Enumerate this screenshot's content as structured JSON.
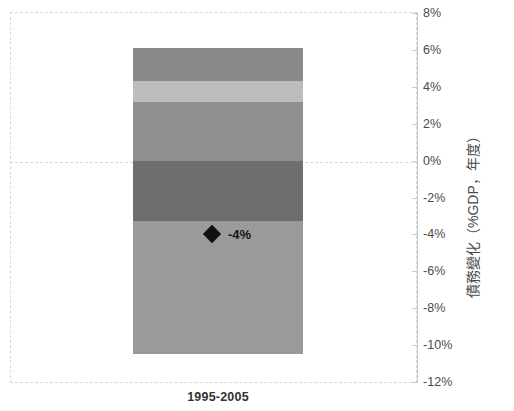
{
  "chart_data": {
    "type": "bar",
    "title": "",
    "subtitle": "",
    "xlabel": "",
    "ylabel": "債務變化（%GDP，年度）",
    "categories": [
      "1995-2005"
    ],
    "ylim": [
      -12,
      8
    ],
    "ytick_labels": [
      "8%",
      "6%",
      "4%",
      "2%",
      "0%",
      "-2%",
      "-4%",
      "-6%",
      "-8%",
      "-10%",
      "-12%"
    ],
    "ytick_values": [
      8,
      6,
      4,
      2,
      0,
      -2,
      -4,
      -6,
      -8,
      -10,
      -12
    ],
    "grid": "zero-line-only",
    "legend": "none",
    "stacked": true,
    "series": [
      {
        "name": "segment-1",
        "values": [
          1.8
        ],
        "range": [
          4.3,
          6.1
        ],
        "color": "#8a8a8a"
      },
      {
        "name": "segment-2",
        "values": [
          1.1
        ],
        "range": [
          3.2,
          4.3
        ],
        "color": "#bdbdbd"
      },
      {
        "name": "segment-3",
        "values": [
          3.2
        ],
        "range": [
          0.0,
          3.2
        ],
        "color": "#8f8f8f"
      },
      {
        "name": "segment-4",
        "values": [
          -3.3
        ],
        "range": [
          -3.3,
          0.0
        ],
        "color": "#6e6e6e"
      },
      {
        "name": "segment-5",
        "values": [
          -7.2
        ],
        "range": [
          -10.5,
          -3.3
        ],
        "color": "#9a9a9a"
      }
    ],
    "annotations": [
      {
        "name": "net-change-marker",
        "label": "-4%",
        "value": -4,
        "marker": "diamond",
        "color": "#111111"
      }
    ],
    "total_top": 6.1,
    "total_bottom": -10.5
  },
  "axis": {
    "title": "債務變化（%GDP，年度）",
    "ticks": [
      "8%",
      "6%",
      "4%",
      "2%",
      "0%",
      "-2%",
      "-4%",
      "-6%",
      "-8%",
      "-10%",
      "-12%"
    ]
  },
  "category": {
    "label": "1995-2005"
  },
  "marker": {
    "label": "-4%"
  },
  "colors": {
    "segment_1": "#8a8a8a",
    "segment_2": "#bdbdbd",
    "segment_3": "#8f8f8f",
    "segment_4": "#6e6e6e",
    "segment_5": "#9a9a9a",
    "marker": "#111111",
    "grid": "#d9d9d9",
    "axis": "#c8c8c8",
    "text": "#4a4a4a"
  }
}
